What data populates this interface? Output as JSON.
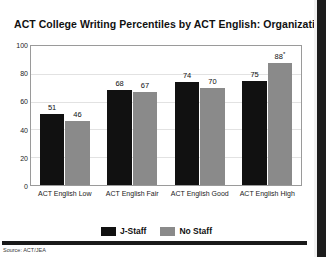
{
  "chart_data": {
    "type": "bar",
    "title": "ACT College Writing Percentiles by ACT English:  Organization",
    "xlabel": "",
    "ylabel": "",
    "ylim": [
      0,
      100
    ],
    "yticks": [
      0,
      20,
      40,
      60,
      80,
      100
    ],
    "grid": true,
    "legend_position": "bottom-center",
    "categories": [
      "ACT English Low",
      "ACT English Fair",
      "ACT English Good",
      "ACT English High"
    ],
    "series": [
      {
        "name": "J-Staff",
        "color": "#111111",
        "values": [
          51,
          68,
          74,
          75
        ],
        "labels": [
          "51",
          "68",
          "74",
          "75"
        ]
      },
      {
        "name": "No Staff",
        "color": "#8a8a8a",
        "values": [
          46,
          67,
          70,
          88
        ],
        "labels": [
          "46",
          "67",
          "70",
          "88"
        ],
        "label_marks": [
          "",
          "",
          "",
          "*"
        ]
      }
    ]
  },
  "footer": {
    "source": "Source: ACT/JEA"
  }
}
